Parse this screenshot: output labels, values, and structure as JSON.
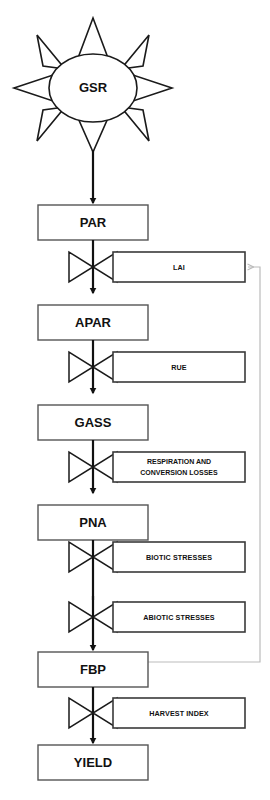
{
  "diagram": {
    "source_node": {
      "id": "gsr",
      "label": "GSR",
      "shape": "sun",
      "ray_count": 8
    },
    "stocks": [
      {
        "id": "par",
        "label": "PAR"
      },
      {
        "id": "apar",
        "label": "APAR"
      },
      {
        "id": "gass",
        "label": "GASS"
      },
      {
        "id": "pna",
        "label": "PNA"
      },
      {
        "id": "fbp",
        "label": "FBP"
      },
      {
        "id": "yield",
        "label": "YIELD"
      }
    ],
    "converters": [
      {
        "id": "lai",
        "label": "LAI",
        "line2": ""
      },
      {
        "id": "rue",
        "label": "RUE",
        "line2": ""
      },
      {
        "id": "resp",
        "label": "RESPIRATION AND",
        "line2": "CONVERSION LOSSES"
      },
      {
        "id": "biotic",
        "label": "BIOTIC STRESSES",
        "line2": ""
      },
      {
        "id": "abiotic",
        "label": "ABIOTIC STRESSES",
        "line2": ""
      },
      {
        "id": "hi",
        "label": "HARVEST INDEX",
        "line2": ""
      }
    ],
    "feedback": {
      "from": "FBP",
      "to": "LAI",
      "style": "light-gray-line-with-arrow"
    },
    "colors": {
      "background": "#ffffff",
      "box_stroke": "#555555",
      "aux_stroke": "#3a3a3a",
      "flow_stroke": "#111111",
      "feedback_stroke": "#bbbbbb",
      "text": "#111111"
    }
  }
}
